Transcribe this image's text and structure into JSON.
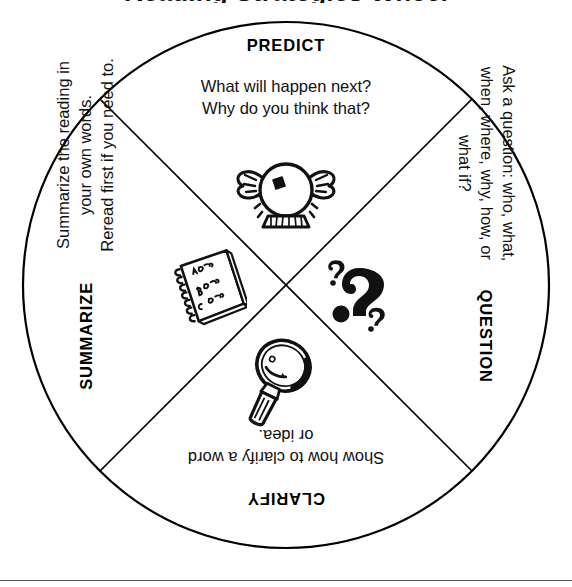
{
  "page": {
    "title": "Reading Strategies Wheel"
  },
  "wheel": {
    "quadrants": [
      {
        "id": "predict",
        "heading": "PREDICT",
        "lines": [
          "What will happen next?",
          "Why do you think that?"
        ],
        "icon": "crystal-ball-icon",
        "orientation": "upright"
      },
      {
        "id": "question",
        "heading": "QUESTION",
        "lines": [
          "Ask a question: who, what,",
          "when, where, why, how, or",
          "what if?"
        ],
        "icon": "question-marks-icon",
        "orientation": "rotated-cw"
      },
      {
        "id": "clarify",
        "heading": "CLARIFY",
        "lines": [
          "Show how to clarify a word",
          "or idea."
        ],
        "icon": "magnifier-icon",
        "orientation": "upside-down"
      },
      {
        "id": "summarize",
        "heading": "SUMMARIZE",
        "lines": [
          "Summarize the reading in",
          "your own words.",
          "Reread first if you need to."
        ],
        "icon": "notebook-icon",
        "orientation": "rotated-ccw"
      }
    ]
  },
  "colors": {
    "ink": "#111111",
    "line": "#000000",
    "rule": "#555555",
    "background": "#ffffff"
  }
}
